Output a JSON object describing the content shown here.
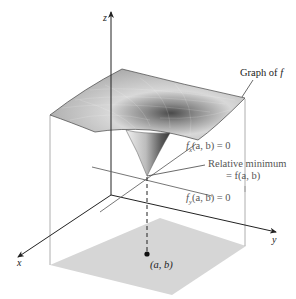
{
  "figure": {
    "axes": {
      "x_label": "x",
      "y_label": "y",
      "z_label": "z"
    },
    "annotations": {
      "graph_label_prefix": "Graph of ",
      "graph_label_f": "f",
      "fx_label_f": "f",
      "fx_label_sub": "x",
      "fx_label_rest": "(a, b) = 0",
      "relmin_line1": "Relative minimum",
      "relmin_line2": "= f(a, b)",
      "fy_label_f": "f",
      "fy_label_sub": "y",
      "fy_label_rest": "(a, b) = 0",
      "point_label": "(a, b)"
    },
    "colors": {
      "surface": "#c8c8c8",
      "surface_dark": "#6e6e6e",
      "domain_region": "#d4d4d4",
      "axis": "#222222",
      "guide_line": "#777777"
    }
  }
}
